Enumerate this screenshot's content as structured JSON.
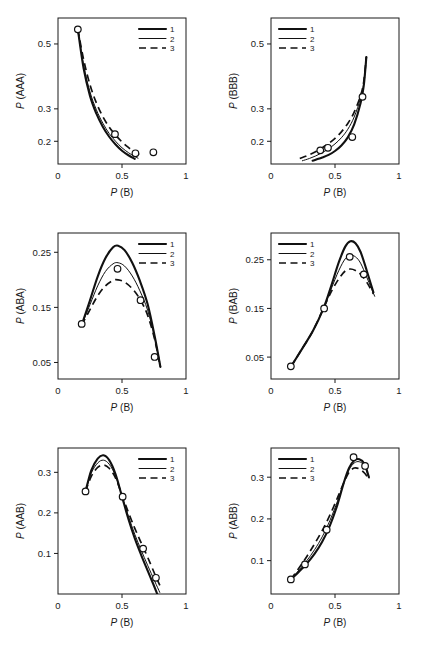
{
  "figure": {
    "panel_count": 6,
    "marker_style": "open-circle",
    "caption_partial": ""
  },
  "legend": {
    "entries": [
      {
        "label": "1",
        "style": "solid-thick"
      },
      {
        "label": "2",
        "style": "solid-thin"
      },
      {
        "label": "3",
        "style": "dashed"
      }
    ]
  },
  "chart_data": [
    {
      "type": "line",
      "panel": "top-left",
      "title": "",
      "xlabel": "P (B)",
      "ylabel": "P (AAA)",
      "xlim": [
        0,
        1
      ],
      "ylim": [
        0.13,
        0.58
      ],
      "xticks": [
        0,
        0.5,
        1
      ],
      "xticklabels": [
        "0",
        "0.5",
        "1"
      ],
      "yticks": [
        0.2,
        0.3,
        0.5
      ],
      "yticklabels": [
        "0.2",
        "0.3",
        "0.5"
      ],
      "grid": false,
      "legend_position": "top-right",
      "series": [
        {
          "name": "1",
          "style": "solid-thick",
          "x": [
            0.155,
            0.2,
            0.25,
            0.3,
            0.35,
            0.4,
            0.45,
            0.5,
            0.55,
            0.6
          ],
          "y": [
            0.545,
            0.425,
            0.34,
            0.285,
            0.245,
            0.214,
            0.19,
            0.171,
            0.157,
            0.146
          ]
        },
        {
          "name": "2",
          "style": "solid-thin",
          "x": [
            0.155,
            0.2,
            0.25,
            0.3,
            0.35,
            0.4,
            0.45,
            0.5,
            0.55,
            0.6,
            0.625
          ],
          "y": [
            0.545,
            0.435,
            0.352,
            0.297,
            0.256,
            0.224,
            0.2,
            0.18,
            0.165,
            0.153,
            0.148
          ]
        },
        {
          "name": "3",
          "style": "dashed",
          "x": [
            0.155,
            0.2,
            0.25,
            0.3,
            0.35,
            0.4,
            0.45,
            0.5,
            0.55,
            0.6,
            0.635
          ],
          "y": [
            0.545,
            0.452,
            0.374,
            0.318,
            0.276,
            0.244,
            0.219,
            0.198,
            0.181,
            0.167,
            0.159
          ]
        }
      ],
      "points": {
        "x": [
          0.155,
          0.445,
          0.605,
          0.745
        ],
        "y": [
          0.545,
          0.222,
          0.163,
          0.166
        ]
      }
    },
    {
      "type": "line",
      "panel": "top-right",
      "title": "",
      "xlabel": "P (B)",
      "ylabel": "P (BBB)",
      "xlim": [
        0,
        1
      ],
      "ylim": [
        0.13,
        0.58
      ],
      "xticks": [
        0,
        0.5,
        1
      ],
      "xticklabels": [
        "0",
        "0.5",
        "1"
      ],
      "yticks": [
        0.2,
        0.3,
        0.5
      ],
      "yticklabels": [
        "0.2",
        "0.3",
        "0.5"
      ],
      "grid": false,
      "legend_position": "top-left",
      "series": [
        {
          "name": "1",
          "style": "solid-thick",
          "x": [
            0.325,
            0.4,
            0.45,
            0.5,
            0.55,
            0.6,
            0.65,
            0.7,
            0.725,
            0.745
          ],
          "y": [
            0.14,
            0.15,
            0.158,
            0.17,
            0.187,
            0.212,
            0.252,
            0.318,
            0.372,
            0.46
          ]
        },
        {
          "name": "2",
          "style": "solid-thin",
          "x": [
            0.245,
            0.3,
            0.35,
            0.4,
            0.45,
            0.5,
            0.55,
            0.6,
            0.65,
            0.7,
            0.725,
            0.745
          ],
          "y": [
            0.14,
            0.147,
            0.155,
            0.165,
            0.177,
            0.192,
            0.211,
            0.237,
            0.275,
            0.333,
            0.38,
            0.46
          ]
        },
        {
          "name": "3",
          "style": "dashed",
          "x": [
            0.225,
            0.28,
            0.34,
            0.4,
            0.45,
            0.5,
            0.55,
            0.6,
            0.65,
            0.7,
            0.725,
            0.745
          ],
          "y": [
            0.147,
            0.155,
            0.166,
            0.18,
            0.193,
            0.209,
            0.229,
            0.255,
            0.29,
            0.341,
            0.385,
            0.46
          ]
        }
      ],
      "points": {
        "x": [
          0.385,
          0.445,
          0.635,
          0.715
        ],
        "y": [
          0.172,
          0.18,
          0.213,
          0.337
        ]
      }
    },
    {
      "type": "line",
      "panel": "middle-left",
      "title": "",
      "xlabel": "P (B)",
      "ylabel": "P (ABA)",
      "xlim": [
        0,
        1
      ],
      "ylim": [
        0.02,
        0.285
      ],
      "xticks": [
        0,
        0.5,
        1
      ],
      "xticklabels": [
        "0",
        "0.5",
        "1"
      ],
      "yticks": [
        0.05,
        0.15,
        0.25
      ],
      "yticklabels": [
        "0.05",
        "0.15",
        "0.25"
      ],
      "grid": false,
      "legend_position": "top-right",
      "series": [
        {
          "name": "1",
          "style": "solid-thick",
          "x": [
            0.185,
            0.25,
            0.31,
            0.37,
            0.43,
            0.47,
            0.52,
            0.58,
            0.64,
            0.7,
            0.755,
            0.8
          ],
          "y": [
            0.118,
            0.163,
            0.206,
            0.239,
            0.259,
            0.262,
            0.254,
            0.231,
            0.198,
            0.156,
            0.098,
            0.042
          ]
        },
        {
          "name": "2",
          "style": "solid-thin",
          "x": [
            0.185,
            0.25,
            0.31,
            0.37,
            0.43,
            0.47,
            0.52,
            0.58,
            0.64,
            0.7,
            0.755,
            0.8
          ],
          "y": [
            0.118,
            0.155,
            0.189,
            0.215,
            0.229,
            0.231,
            0.225,
            0.207,
            0.18,
            0.145,
            0.095,
            0.042
          ]
        },
        {
          "name": "3",
          "style": "dashed",
          "x": [
            0.185,
            0.25,
            0.31,
            0.37,
            0.43,
            0.47,
            0.52,
            0.58,
            0.64,
            0.7,
            0.755,
            0.8
          ],
          "y": [
            0.118,
            0.146,
            0.171,
            0.189,
            0.199,
            0.2,
            0.196,
            0.184,
            0.165,
            0.136,
            0.092,
            0.042
          ]
        }
      ],
      "points": {
        "x": [
          0.185,
          0.465,
          0.645,
          0.755
        ],
        "y": [
          0.12,
          0.22,
          0.163,
          0.06
        ]
      }
    },
    {
      "type": "line",
      "panel": "middle-right",
      "title": "",
      "xlabel": "P (B)",
      "ylabel": "P (BAB)",
      "xlim": [
        0,
        1
      ],
      "ylim": [
        0.005,
        0.305
      ],
      "xticks": [
        0,
        0.5,
        1
      ],
      "xticklabels": [
        "0",
        "0.5",
        "1"
      ],
      "yticks": [
        0.05,
        0.15,
        0.25
      ],
      "yticklabels": [
        "0.05",
        "0.15",
        "0.25"
      ],
      "grid": false,
      "legend_position": "top-left",
      "series": [
        {
          "name": "1",
          "style": "solid-thick",
          "x": [
            0.155,
            0.25,
            0.33,
            0.41,
            0.47,
            0.53,
            0.58,
            0.62,
            0.66,
            0.7,
            0.75,
            0.8
          ],
          "y": [
            0.03,
            0.07,
            0.105,
            0.15,
            0.196,
            0.245,
            0.277,
            0.288,
            0.284,
            0.266,
            0.226,
            0.183
          ]
        },
        {
          "name": "2",
          "style": "solid-thin",
          "x": [
            0.155,
            0.25,
            0.33,
            0.41,
            0.47,
            0.53,
            0.58,
            0.62,
            0.66,
            0.7,
            0.75,
            0.81
          ],
          "y": [
            0.03,
            0.07,
            0.105,
            0.15,
            0.19,
            0.228,
            0.252,
            0.259,
            0.256,
            0.243,
            0.213,
            0.175
          ]
        },
        {
          "name": "3",
          "style": "dashed",
          "x": [
            0.155,
            0.25,
            0.33,
            0.41,
            0.47,
            0.53,
            0.58,
            0.62,
            0.66,
            0.7,
            0.75,
            0.8
          ],
          "y": [
            0.03,
            0.07,
            0.105,
            0.15,
            0.184,
            0.211,
            0.227,
            0.231,
            0.228,
            0.22,
            0.203,
            0.18
          ]
        }
      ],
      "points": {
        "x": [
          0.155,
          0.415,
          0.615,
          0.725
        ],
        "y": [
          0.031,
          0.15,
          0.256,
          0.22
        ]
      }
    },
    {
      "type": "line",
      "panel": "bottom-left",
      "title": "",
      "xlabel": "P (B)",
      "ylabel": "P (AAB)",
      "xlim": [
        0,
        1
      ],
      "ylim": [
        0.0,
        0.36
      ],
      "xticks": [
        0,
        0.5,
        1
      ],
      "xticklabels": [
        "0",
        "0.5",
        "1"
      ],
      "yticks": [
        0.1,
        0.2,
        0.3
      ],
      "yticklabels": [
        "0.1",
        "0.2",
        "0.3"
      ],
      "grid": false,
      "legend_position": "top-right",
      "series": [
        {
          "name": "1",
          "style": "solid-thick",
          "x": [
            0.215,
            0.26,
            0.31,
            0.355,
            0.4,
            0.45,
            0.5,
            0.55,
            0.6,
            0.65,
            0.7,
            0.745,
            0.775
          ],
          "y": [
            0.253,
            0.305,
            0.334,
            0.342,
            0.33,
            0.295,
            0.24,
            0.185,
            0.137,
            0.096,
            0.058,
            0.024,
            0.0
          ]
        },
        {
          "name": "2",
          "style": "solid-thin",
          "x": [
            0.215,
            0.26,
            0.31,
            0.355,
            0.4,
            0.45,
            0.5,
            0.55,
            0.6,
            0.65,
            0.7,
            0.755,
            0.795
          ],
          "y": [
            0.253,
            0.298,
            0.323,
            0.33,
            0.32,
            0.291,
            0.242,
            0.192,
            0.147,
            0.108,
            0.071,
            0.032,
            0.004
          ]
        },
        {
          "name": "3",
          "style": "dashed",
          "x": [
            0.215,
            0.26,
            0.31,
            0.355,
            0.4,
            0.45,
            0.5,
            0.55,
            0.6,
            0.65,
            0.7,
            0.755,
            0.8
          ],
          "y": [
            0.253,
            0.29,
            0.312,
            0.318,
            0.31,
            0.286,
            0.244,
            0.201,
            0.162,
            0.126,
            0.091,
            0.05,
            0.018
          ]
        }
      ],
      "points": {
        "x": [
          0.215,
          0.505,
          0.665,
          0.765
        ],
        "y": [
          0.253,
          0.24,
          0.112,
          0.04
        ]
      }
    },
    {
      "type": "line",
      "panel": "bottom-right",
      "title": "",
      "xlabel": "P (B)",
      "ylabel": "P (ABB)",
      "xlim": [
        0,
        1
      ],
      "ylim": [
        0.02,
        0.37
      ],
      "xticks": [
        0,
        0.5,
        1
      ],
      "xticklabels": [
        "0",
        "0.5",
        "1"
      ],
      "yticks": [
        0.1,
        0.2,
        0.3
      ],
      "yticklabels": [
        "0.1",
        "0.2",
        "0.3"
      ],
      "grid": false,
      "legend_position": "top-left",
      "series": [
        {
          "name": "1",
          "style": "solid-thick",
          "x": [
            0.155,
            0.22,
            0.28,
            0.34,
            0.4,
            0.46,
            0.52,
            0.57,
            0.61,
            0.65,
            0.69,
            0.73,
            0.765
          ],
          "y": [
            0.055,
            0.074,
            0.093,
            0.116,
            0.145,
            0.184,
            0.235,
            0.288,
            0.322,
            0.34,
            0.343,
            0.332,
            0.3
          ]
        },
        {
          "name": "2",
          "style": "solid-thin",
          "x": [
            0.155,
            0.22,
            0.28,
            0.34,
            0.4,
            0.46,
            0.52,
            0.57,
            0.61,
            0.65,
            0.69,
            0.73,
            0.765
          ],
          "y": [
            0.055,
            0.078,
            0.1,
            0.126,
            0.157,
            0.196,
            0.243,
            0.288,
            0.318,
            0.334,
            0.337,
            0.327,
            0.298
          ]
        },
        {
          "name": "3",
          "style": "dashed",
          "x": [
            0.155,
            0.22,
            0.28,
            0.34,
            0.4,
            0.46,
            0.52,
            0.57,
            0.61,
            0.65,
            0.69,
            0.73,
            0.765
          ],
          "y": [
            0.055,
            0.083,
            0.11,
            0.14,
            0.172,
            0.209,
            0.251,
            0.288,
            0.312,
            0.322,
            0.32,
            0.31,
            0.296
          ]
        }
      ],
      "points": {
        "x": [
          0.155,
          0.265,
          0.435,
          0.645,
          0.735
        ],
        "y": [
          0.055,
          0.091,
          0.174,
          0.348,
          0.327
        ]
      }
    }
  ]
}
